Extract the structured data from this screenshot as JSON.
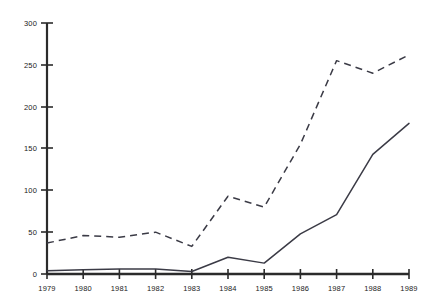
{
  "chart_data": {
    "type": "line",
    "title": "",
    "subtitle": "",
    "xlabel": "",
    "ylabel": "",
    "x": [
      1979,
      1980,
      1981,
      1982,
      1983,
      1984,
      1985,
      1986,
      1987,
      1988,
      1989
    ],
    "x_tick_labels": [
      "1979",
      "1980",
      "1981",
      "1982",
      "1983",
      "1984",
      "1985",
      "1986",
      "1987",
      "1988",
      "1989"
    ],
    "y_tick_labels": [
      "0",
      "50",
      "100",
      "150",
      "200",
      "250",
      "300"
    ],
    "y_ticks": [
      0,
      50,
      100,
      150,
      200,
      250,
      300
    ],
    "ylim": [
      0,
      300
    ],
    "xlim": [
      1979,
      1989
    ],
    "grid": false,
    "legend": "none",
    "series": [
      {
        "name": "dashed-series",
        "style": "dashed",
        "color": "#3b3b46",
        "values": [
          37,
          46,
          44,
          50,
          33,
          93,
          80,
          155,
          255,
          240,
          262
        ]
      },
      {
        "name": "solid-series",
        "style": "solid",
        "color": "#3b3b46",
        "values": [
          4,
          5,
          6,
          6,
          3,
          20,
          13,
          48,
          71,
          143,
          180
        ]
      }
    ]
  },
  "axes": {
    "y_axis_name": "value-axis",
    "x_axis_name": "year-axis"
  }
}
